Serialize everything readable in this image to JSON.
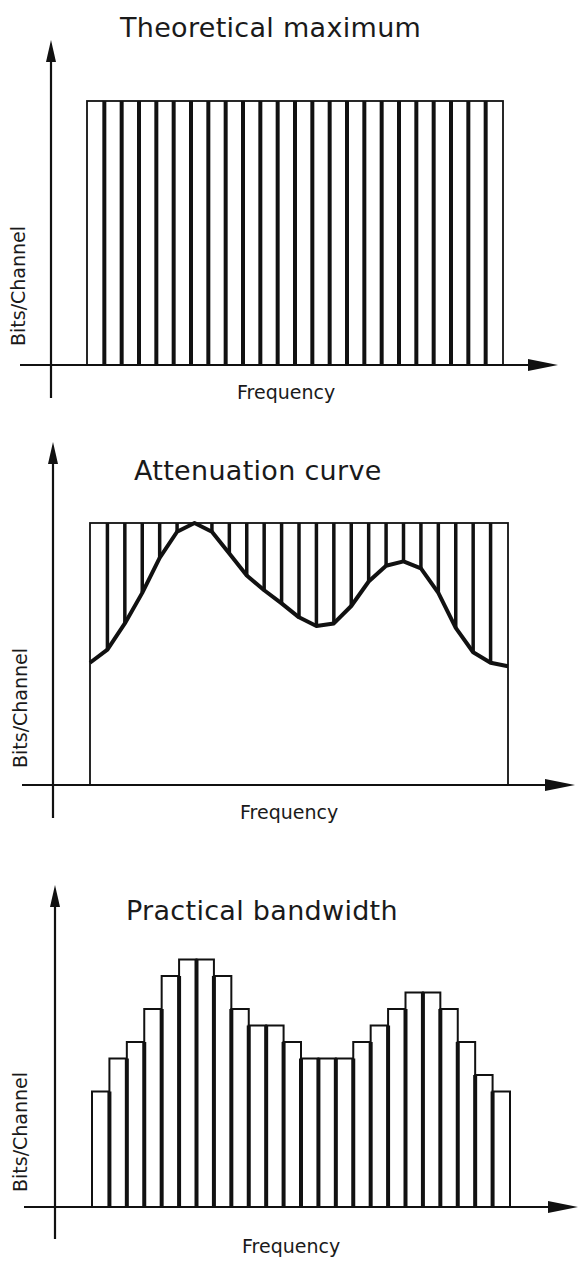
{
  "colors": {
    "ink": "#111111",
    "background": "#ffffff"
  },
  "chart_data": [
    {
      "type": "bar",
      "title": "Theoretical maximum",
      "xlabel": "Frequency",
      "ylabel": "Bits/Channel",
      "channel_count": 24,
      "values": [
        15,
        15,
        15,
        15,
        15,
        15,
        15,
        15,
        15,
        15,
        15,
        15,
        15,
        15,
        15,
        15,
        15,
        15,
        15,
        15,
        15,
        15,
        15,
        15
      ],
      "ylim": [
        0,
        17
      ],
      "grid": false,
      "note": "Uniform maximum bits per channel across all frequency channels (relative units)"
    },
    {
      "type": "line",
      "title": "Attenuation curve",
      "xlabel": "Frequency",
      "ylabel": "Bits/Channel",
      "channel_count": 24,
      "series": [
        {
          "name": "Theoretical maximum (envelope)",
          "values": [
            15,
            15,
            15,
            15,
            15,
            15,
            15,
            15,
            15,
            15,
            15,
            15,
            15,
            15,
            15,
            15,
            15,
            15,
            15,
            15,
            15,
            15,
            15,
            15
          ]
        },
        {
          "name": "Attenuation curve",
          "values": [
            7,
            8.5,
            10,
            12,
            14,
            15,
            15,
            14,
            12.5,
            11.5,
            10.8,
            10,
            9.2,
            9,
            9.5,
            11,
            12.3,
            12.8,
            12.8,
            12,
            10,
            8,
            7.2,
            6.8
          ]
        }
      ],
      "ylim": [
        0,
        17
      ],
      "grid": false,
      "note": "Hatched region between max envelope and curve represents lost capacity"
    },
    {
      "type": "bar",
      "title": "Practical bandwidth",
      "xlabel": "Frequency",
      "ylabel": "Bits/Channel",
      "channel_count": 24,
      "values": [
        7,
        9,
        10,
        12,
        14,
        15,
        15,
        14,
        12,
        11,
        11,
        10,
        9,
        9,
        9,
        10,
        11,
        12,
        13,
        13,
        12,
        10,
        8,
        7
      ],
      "ylim": [
        0,
        17
      ],
      "grid": false
    }
  ],
  "panels": [
    {
      "title": "Theoretical maximum",
      "xlabel": "Frequency",
      "ylabel": "Bits/Channel"
    },
    {
      "title": "Attenuation curve",
      "xlabel": "Frequency",
      "ylabel": "Bits/Channel"
    },
    {
      "title": "Practical bandwidth",
      "xlabel": "Frequency",
      "ylabel": "Bits/Channel"
    }
  ]
}
